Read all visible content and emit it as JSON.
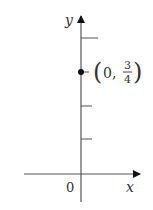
{
  "diagram": {
    "axes": {
      "x_label": "x",
      "y_label": "y",
      "origin_label": "0",
      "color": "#555555"
    },
    "y_ticks": [
      0.25,
      0.5,
      0.75,
      1
    ],
    "point": {
      "x": 0,
      "y": 0.75,
      "label_open": "(",
      "label_x": "0,",
      "label_num": "3",
      "label_den": "4",
      "label_close": ")",
      "color": "#111111"
    }
  }
}
